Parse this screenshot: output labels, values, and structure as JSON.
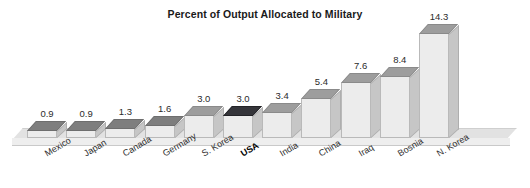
{
  "chart_data": {
    "type": "bar",
    "title": "Percent of Output Allocated to Military",
    "xlabel": "",
    "ylabel": "",
    "ylim": [
      0,
      14.3
    ],
    "grid": false,
    "legend": null,
    "style": "3d-bar",
    "categories": [
      "Mexico",
      "Japan",
      "Canada",
      "Germany",
      "S. Korea",
      "USA",
      "India",
      "China",
      "Iraq",
      "Bosnia",
      "N. Korea"
    ],
    "values": [
      0.9,
      0.9,
      1.3,
      1.6,
      3.0,
      3.0,
      3.4,
      5.4,
      7.6,
      8.4,
      14.3
    ],
    "value_labels": [
      "0.9",
      "0.9",
      "1.3",
      "1.6",
      "3.0",
      "3.0",
      "3.4",
      "5.4",
      "7.6",
      "8.4",
      "14.3"
    ],
    "highlighted_category": "USA"
  },
  "colors": {
    "background": "#ffffff",
    "bar_front": "#ececec",
    "bar_side": "#c6c6c6",
    "bar_top": "#9d9d9d",
    "bar_top_short": "#7e7e7e",
    "bar_top_highlight": "#35353a",
    "floor": "#e2e2e2",
    "text": "#2b2b2b",
    "title": "#1a1a1a"
  }
}
